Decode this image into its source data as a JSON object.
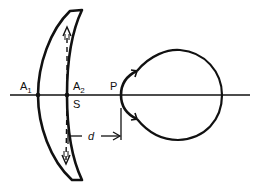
{
  "figure": {
    "type": "optics-diagram"
  },
  "labels": {
    "a1": {
      "main": "A",
      "sub": "1"
    },
    "a2": {
      "main": "A",
      "sub": "2"
    },
    "s": "S",
    "p": "P",
    "d": "d"
  },
  "colors": {
    "ink": "#111111",
    "background": "#ffffff"
  }
}
